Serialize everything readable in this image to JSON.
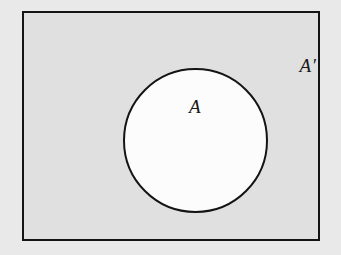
{
  "figure": {
    "type": "venn-diagram",
    "width": 341,
    "height": 255
  },
  "colors": {
    "page_background": "#ffffff",
    "outer_background": "#e9e9e9",
    "universe_fill": "#e0e0e0",
    "set_fill": "#fcfcfc",
    "stroke": "#141414",
    "label_color": "#181818"
  },
  "labels": {
    "set_a": "A",
    "set_a_complement": "A′"
  },
  "geometry": {
    "rect": {
      "x": 22,
      "y": 11,
      "width": 298,
      "height": 230,
      "stroke_width": 2.5
    },
    "circle": {
      "cx": 171,
      "cy": 127,
      "r": 72,
      "stroke_width": 2.5
    },
    "label_set_a_position": {
      "x": 171,
      "y": 93
    },
    "label_set_a_complement_position": {
      "x": 284,
      "y": 52
    }
  }
}
